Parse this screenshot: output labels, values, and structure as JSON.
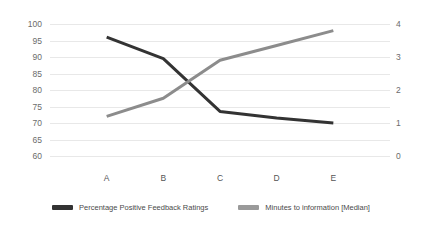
{
  "chart_data": {
    "type": "line",
    "title": "",
    "xlabel": "",
    "categories": [
      "A",
      "B",
      "C",
      "D",
      "E"
    ],
    "grid": true,
    "legend_position": "bottom",
    "series": [
      {
        "name": "Percentage Positive Feedback Ratings",
        "axis": "left",
        "color": "#333333",
        "values": [
          96,
          89.5,
          73.5,
          71.5,
          70
        ]
      },
      {
        "name": "Minutes to information [Median]",
        "axis": "right",
        "color": "#8c8c8c",
        "values": [
          1.2,
          1.75,
          2.9,
          3.35,
          3.8
        ]
      }
    ],
    "left_axis": {
      "label": "",
      "min": 60,
      "max": 100,
      "step": 5,
      "ticks": [
        "100",
        "95",
        "90",
        "85",
        "80",
        "75",
        "70",
        "65",
        "60"
      ]
    },
    "right_axis": {
      "label": "",
      "min": 0,
      "max": 4,
      "step": 1,
      "ticks": [
        "4",
        "3",
        "2",
        "1",
        "0"
      ]
    }
  },
  "legend": {
    "items": [
      {
        "label": "Percentage Positive Feedback Ratings",
        "color": "#333333"
      },
      {
        "label": "Minutes to information [Median]",
        "color": "#9a9a9a"
      }
    ]
  }
}
